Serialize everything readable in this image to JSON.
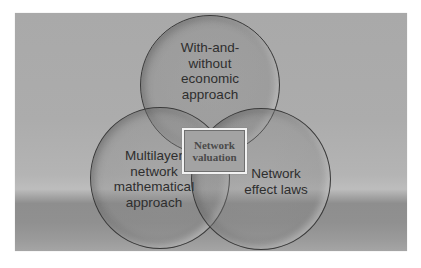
{
  "diagram": {
    "type": "venn",
    "center": {
      "label": "Network\nvaluation"
    },
    "sets": [
      {
        "id": "top",
        "label": "With-and-\nwithout\neconomic\napproach"
      },
      {
        "id": "left",
        "label": "Multilayer\nnetwork\nmathematical\napproach"
      },
      {
        "id": "right",
        "label": "Network\neffect laws"
      }
    ]
  },
  "colors": {
    "background_panel": "#a9a9a9",
    "circle_outline": "#3a3a3a",
    "text": "#2e2e2e",
    "center_box_border": "#f2f2f2",
    "center_box_fill": "#a3a3a3"
  }
}
